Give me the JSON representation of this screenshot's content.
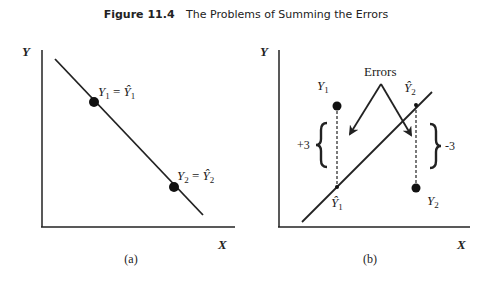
{
  "figure": {
    "number": "Figure 11.4",
    "title": "The Problems of Summing the Errors"
  },
  "panel_a": {
    "caption": "(a)",
    "axis_y_label": "Y",
    "axis_x_label": "X",
    "point1_label": "Y₁ = Ŷ₁",
    "point2_label": "Y₂ = Ŷ₂",
    "point1_base": "Y",
    "point1_sub": "1",
    "point1_rhs_base": "Ŷ",
    "point1_rhs_sub": "1",
    "point2_base": "Y",
    "point2_sub": "2",
    "point2_rhs_base": "Ŷ",
    "point2_rhs_sub": "2",
    "line_slope": "negative"
  },
  "panel_b": {
    "caption": "(b)",
    "axis_y_label": "Y",
    "axis_x_label": "X",
    "errors_label": "Errors",
    "y1_base": "Y",
    "y1_sub": "1",
    "yhat1_base": "Ŷ",
    "yhat1_sub": "1",
    "yhat2_base": "Ŷ",
    "yhat2_sub": "2",
    "y2_base": "Y",
    "y2_sub": "2",
    "error1_value": "+3",
    "error2_value": "-3",
    "line_slope": "positive"
  },
  "colors": {
    "ink": "#222222",
    "background": "#ffffff"
  }
}
